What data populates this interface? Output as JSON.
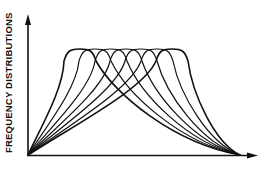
{
  "chart_data": {
    "type": "line",
    "title": "",
    "ylabel": "FREQUENCY DISTRIBUTIONS",
    "xlabel": "",
    "grid": false,
    "legend": null,
    "axis_ticks": false,
    "origin_px": [
      28,
      155
    ],
    "end_px": [
      240,
      155
    ],
    "peak_height_px": 49,
    "series": [
      {
        "name": "curve-1",
        "peak_x_px": 80
      },
      {
        "name": "curve-2",
        "peak_x_px": 95
      },
      {
        "name": "curve-3",
        "peak_x_px": 111
      },
      {
        "name": "curve-4",
        "peak_x_px": 126
      },
      {
        "name": "curve-5",
        "peak_x_px": 141
      },
      {
        "name": "curve-6",
        "peak_x_px": 157
      },
      {
        "name": "curve-7",
        "peak_x_px": 172
      }
    ],
    "colors": {
      "line": "#111111",
      "background": "#ffffff"
    }
  },
  "labels": {
    "y_axis": "FREQUENCY DISTRIBUTIONS"
  }
}
